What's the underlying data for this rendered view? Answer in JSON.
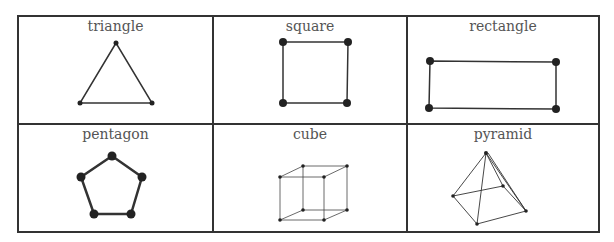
{
  "shapes": [
    {
      "name": "triangle"
    },
    {
      "name": "square"
    },
    {
      "name": "rectangle"
    },
    {
      "name": "pentagon"
    },
    {
      "name": "cube"
    },
    {
      "name": "pyramid"
    }
  ],
  "colors": {
    "line": "#333333",
    "label": "#555555"
  }
}
